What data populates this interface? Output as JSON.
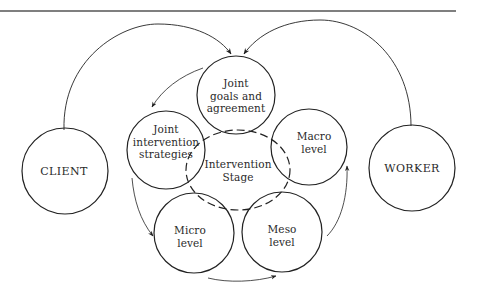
{
  "diagram": {
    "colors": {
      "stroke": "#222222",
      "text": "#2a2a2a",
      "background": "#ffffff",
      "rule": "#555555"
    },
    "nodes": {
      "client": {
        "label": "CLIENT",
        "cx": 65,
        "cy": 171,
        "r": 43
      },
      "worker": {
        "label": "WORKER",
        "cx": 412,
        "cy": 168,
        "r": 43
      },
      "goals": {
        "label": "Joint\ngoals and\nagreement",
        "cx": 236,
        "cy": 95,
        "r": 39
      },
      "strategies": {
        "label": "Joint\nintervention\nstrategies",
        "cx": 166,
        "cy": 150,
        "r": 39
      },
      "macro": {
        "label": "Macro\nlevel",
        "cx": 309,
        "cy": 147,
        "r": 38
      },
      "micro": {
        "label": "Micro\nlevel",
        "cx": 194,
        "cy": 233,
        "r": 40
      },
      "meso": {
        "label": "Meso\nlevel",
        "cx": 282,
        "cy": 232,
        "r": 40
      },
      "stage": {
        "label": "Intervention\nStage",
        "cx": 238,
        "cy": 170,
        "rx": 52,
        "ry": 40,
        "dashed": true
      }
    },
    "arrows": [
      {
        "from": "client",
        "to": "goals",
        "name": "client-to-goals-arrow"
      },
      {
        "from": "worker",
        "to": "goals",
        "name": "worker-to-goals-arrow"
      },
      {
        "from": "goals",
        "to": "strategies",
        "name": "goals-to-strategies-arrow"
      },
      {
        "from": "strategies",
        "to": "micro",
        "name": "strategies-to-micro-arrow"
      },
      {
        "from": "micro",
        "to": "meso",
        "name": "micro-to-meso-arrow"
      },
      {
        "from": "meso",
        "to": "macro",
        "name": "meso-to-macro-arrow"
      }
    ]
  }
}
